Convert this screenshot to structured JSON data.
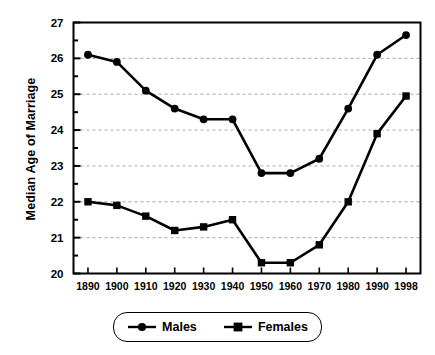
{
  "chart_data": {
    "type": "line",
    "title": "",
    "xlabel": "",
    "ylabel": "Median Age of Marriage",
    "categories": [
      "1890",
      "1900",
      "1910",
      "1920",
      "1930",
      "1940",
      "1950",
      "1960",
      "1970",
      "1980",
      "1990",
      "1998"
    ],
    "x": [
      1890,
      1900,
      1910,
      1920,
      1930,
      1940,
      1950,
      1960,
      1970,
      1980,
      1990,
      1998
    ],
    "ylim": [
      20,
      27
    ],
    "ytick_labels": [
      "20",
      "21",
      "22",
      "23",
      "24",
      "25",
      "26",
      "27"
    ],
    "yticks": [
      20,
      21,
      22,
      23,
      24,
      25,
      26,
      27
    ],
    "y_minor_tick_interval": 0.5,
    "grid": true,
    "grid_style": "dashed",
    "grid_values": [
      21,
      22,
      23,
      24,
      25,
      26
    ],
    "legend_position": "below",
    "series": [
      {
        "name": "Males",
        "marker": "circle",
        "color": "#000000",
        "values": [
          26.1,
          25.9,
          25.1,
          24.6,
          24.3,
          24.3,
          22.8,
          22.8,
          23.2,
          24.6,
          26.1,
          26.65
        ]
      },
      {
        "name": "Females",
        "marker": "square",
        "color": "#000000",
        "values": [
          22.0,
          21.9,
          21.6,
          21.2,
          21.3,
          21.5,
          20.3,
          20.3,
          20.8,
          22.0,
          23.9,
          24.95
        ]
      }
    ]
  },
  "axis": {
    "y_title": "Median Age of Marriage"
  },
  "legend": {
    "items": [
      {
        "label": "Males",
        "marker": "circle"
      },
      {
        "label": "Females",
        "marker": "square"
      }
    ]
  }
}
